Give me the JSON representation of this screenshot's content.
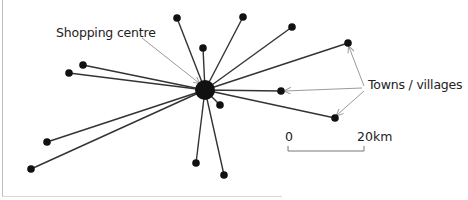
{
  "diagram": {
    "center": {
      "name": "Shopping centre",
      "x": 205,
      "y": 90,
      "r": 10
    },
    "labels": {
      "shopping_centre": "Shopping centre",
      "towns_villages": "Towns / villages"
    },
    "scale": {
      "start": "0",
      "end": "20km"
    },
    "nodes": [
      {
        "x": 177,
        "y": 18
      },
      {
        "x": 243,
        "y": 17
      },
      {
        "x": 292,
        "y": 27
      },
      {
        "x": 203,
        "y": 48
      },
      {
        "x": 348,
        "y": 43
      },
      {
        "x": 281,
        "y": 91
      },
      {
        "x": 335,
        "y": 118
      },
      {
        "x": 83,
        "y": 65
      },
      {
        "x": 69,
        "y": 73
      },
      {
        "x": 47,
        "y": 142
      },
      {
        "x": 31,
        "y": 169
      },
      {
        "x": 196,
        "y": 163
      },
      {
        "x": 224,
        "y": 175
      },
      {
        "x": 220,
        "y": 105
      }
    ],
    "colors": {
      "line": "#333333",
      "node": "#111111",
      "pointer": "#9a9a9a"
    }
  }
}
